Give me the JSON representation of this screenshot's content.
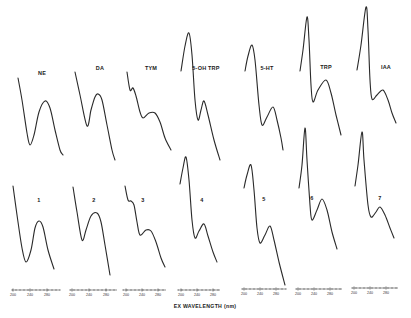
{
  "chart_data": {
    "type": "line",
    "title": "",
    "xlabel": "EX WAVELENGTH (nm)",
    "ylabel": "",
    "grid": false,
    "legend": "none",
    "layout": "2 rows x 7 panels; top row = standards, bottom row = samples",
    "panels": [
      {
        "label": "NE",
        "row": 1,
        "col": 1,
        "shape": "descending, min, then single peak",
        "points": [
          [
            18,
            78
          ],
          [
            22,
            100
          ],
          [
            27,
            133
          ],
          [
            30,
            145
          ],
          [
            34,
            135
          ],
          [
            39,
            112
          ],
          [
            45,
            101
          ],
          [
            50,
            108
          ],
          [
            55,
            130
          ],
          [
            60,
            150
          ],
          [
            63,
            155
          ]
        ]
      },
      {
        "label": "DA",
        "row": 1,
        "col": 2,
        "shape": "descending, min, then single peak",
        "points": [
          [
            75,
            72
          ],
          [
            80,
            95
          ],
          [
            87,
            126
          ],
          [
            91,
            110
          ],
          [
            95,
            97
          ],
          [
            98,
            94
          ],
          [
            102,
            100
          ],
          [
            107,
            125
          ],
          [
            112,
            150
          ],
          [
            115,
            160
          ]
        ]
      },
      {
        "label": "TYM",
        "row": 1,
        "col": 3,
        "shape": "shoulder, descending, broad hump",
        "points": [
          [
            127,
            72
          ],
          [
            130,
            90
          ],
          [
            133,
            88
          ],
          [
            136,
            96
          ],
          [
            140,
            112
          ],
          [
            143,
            118
          ],
          [
            149,
            113
          ],
          [
            155,
            113
          ],
          [
            160,
            122
          ],
          [
            165,
            138
          ],
          [
            171,
            150
          ]
        ]
      },
      {
        "label": "5-OH TRP",
        "row": 1,
        "col": 4,
        "shape": "sharp peak, drop, hump",
        "points": [
          [
            181,
            71
          ],
          [
            185,
            46
          ],
          [
            189,
            33
          ],
          [
            192,
            55
          ],
          [
            195,
            100
          ],
          [
            198,
            120
          ],
          [
            201,
            110
          ],
          [
            204,
            101
          ],
          [
            208,
            115
          ],
          [
            214,
            140
          ],
          [
            220,
            160
          ]
        ]
      },
      {
        "label": "5-HT",
        "row": 1,
        "col": 5,
        "shape": "sharp peak, drop, hump",
        "points": [
          [
            245,
            71
          ],
          [
            248,
            56
          ],
          [
            252,
            45
          ],
          [
            255,
            60
          ],
          [
            259,
            105
          ],
          [
            262,
            125
          ],
          [
            267,
            117
          ],
          [
            273,
            107
          ],
          [
            277,
            120
          ],
          [
            281,
            138
          ],
          [
            283,
            150
          ]
        ]
      },
      {
        "label": "TRP",
        "row": 1,
        "col": 6,
        "shape": "tall sharp peak, drop, hump",
        "points": [
          [
            300,
            71
          ],
          [
            303,
            50
          ],
          [
            307,
            17
          ],
          [
            309,
            40
          ],
          [
            311,
            85
          ],
          [
            313,
            102
          ],
          [
            318,
            90
          ],
          [
            326,
            80
          ],
          [
            331,
            93
          ],
          [
            336,
            115
          ],
          [
            341,
            135
          ]
        ]
      },
      {
        "label": "IAA",
        "row": 1,
        "col": 7,
        "shape": "tall sharp peak, drop, small hump",
        "points": [
          [
            357,
            70
          ],
          [
            361,
            45
          ],
          [
            366,
            7
          ],
          [
            368,
            30
          ],
          [
            370,
            80
          ],
          [
            372,
            99
          ],
          [
            377,
            95
          ],
          [
            383,
            90
          ],
          [
            388,
            100
          ],
          [
            392,
            113
          ],
          [
            396,
            123
          ]
        ]
      },
      {
        "label": "1",
        "row": 2,
        "col": 1,
        "shape": "like NE",
        "points": [
          [
            13,
            186
          ],
          [
            17,
            215
          ],
          [
            22,
            248
          ],
          [
            26,
            262
          ],
          [
            31,
            250
          ],
          [
            35,
            228
          ],
          [
            39,
            221
          ],
          [
            43,
            227
          ],
          [
            48,
            250
          ],
          [
            54,
            269
          ]
        ]
      },
      {
        "label": "2",
        "row": 2,
        "col": 2,
        "shape": "like DA",
        "points": [
          [
            73,
            187
          ],
          [
            77,
            212
          ],
          [
            82,
            240
          ],
          [
            86,
            230
          ],
          [
            91,
            216
          ],
          [
            97,
            213
          ],
          [
            101,
            222
          ],
          [
            105,
            245
          ],
          [
            110,
            275
          ]
        ]
      },
      {
        "label": "3",
        "row": 2,
        "col": 3,
        "shape": "like TYM",
        "points": [
          [
            125,
            186
          ],
          [
            128,
            200
          ],
          [
            131,
            201
          ],
          [
            134,
            205
          ],
          [
            137,
            222
          ],
          [
            140,
            235
          ],
          [
            146,
            230
          ],
          [
            151,
            231
          ],
          [
            156,
            242
          ],
          [
            161,
            258
          ],
          [
            165,
            267
          ]
        ]
      },
      {
        "label": "4",
        "row": 2,
        "col": 4,
        "shape": "like 5-OH TRP",
        "points": [
          [
            180,
            184
          ],
          [
            183,
            168
          ],
          [
            186,
            157
          ],
          [
            189,
            180
          ],
          [
            192,
            220
          ],
          [
            195,
            238
          ],
          [
            199,
            231
          ],
          [
            204,
            224
          ],
          [
            208,
            236
          ],
          [
            213,
            252
          ],
          [
            217,
            262
          ]
        ]
      },
      {
        "label": "5",
        "row": 2,
        "col": 5,
        "shape": "like 5-HT",
        "points": [
          [
            244,
            188
          ],
          [
            247,
            175
          ],
          [
            251,
            165
          ],
          [
            254,
            190
          ],
          [
            257,
            228
          ],
          [
            260,
            243
          ],
          [
            265,
            235
          ],
          [
            270,
            226
          ],
          [
            274,
            240
          ],
          [
            279,
            262
          ],
          [
            285,
            285
          ]
        ]
      },
      {
        "label": "6",
        "row": 2,
        "col": 6,
        "shape": "like TRP",
        "points": [
          [
            299,
            188
          ],
          [
            302,
            165
          ],
          [
            305,
            128
          ],
          [
            307,
            160
          ],
          [
            310,
            205
          ],
          [
            312,
            220
          ],
          [
            317,
            210
          ],
          [
            322,
            199
          ],
          [
            327,
            210
          ],
          [
            332,
            232
          ],
          [
            337,
            249
          ]
        ]
      },
      {
        "label": "7",
        "row": 2,
        "col": 7,
        "shape": "like IAA",
        "points": [
          [
            355,
            186
          ],
          [
            358,
            165
          ],
          [
            362,
            132
          ],
          [
            364,
            160
          ],
          [
            368,
            205
          ],
          [
            371,
            217
          ],
          [
            376,
            212
          ],
          [
            380,
            207
          ],
          [
            385,
            215
          ],
          [
            390,
            228
          ],
          [
            394,
            238
          ]
        ]
      }
    ],
    "axes": [
      {
        "x1": 12,
        "x2": 60,
        "y": 290,
        "ticks": [
          {
            "x": 13,
            "label": "200"
          },
          {
            "x": 30,
            "label": "240"
          },
          {
            "x": 47,
            "label": "280"
          }
        ]
      },
      {
        "x1": 70,
        "x2": 117,
        "y": 290,
        "ticks": [
          {
            "x": 72,
            "label": "200"
          },
          {
            "x": 89,
            "label": "240"
          },
          {
            "x": 106,
            "label": "280"
          }
        ]
      },
      {
        "x1": 123,
        "x2": 166,
        "y": 290,
        "ticks": [
          {
            "x": 126,
            "label": "200"
          },
          {
            "x": 142,
            "label": "240"
          },
          {
            "x": 158,
            "label": "280"
          }
        ]
      },
      {
        "x1": 178,
        "x2": 220,
        "y": 290,
        "ticks": [
          {
            "x": 181,
            "label": "200"
          },
          {
            "x": 197,
            "label": "240"
          },
          {
            "x": 213,
            "label": "280"
          }
        ]
      },
      {
        "x1": 242,
        "x2": 286,
        "y": 289,
        "ticks": [
          {
            "x": 244,
            "label": "200"
          },
          {
            "x": 260,
            "label": "240"
          },
          {
            "x": 276,
            "label": "280"
          }
        ]
      },
      {
        "x1": 296,
        "x2": 342,
        "y": 289,
        "ticks": [
          {
            "x": 298,
            "label": "200"
          },
          {
            "x": 314,
            "label": "240"
          },
          {
            "x": 330,
            "label": "280"
          }
        ]
      },
      {
        "x1": 352,
        "x2": 398,
        "y": 288,
        "ticks": [
          {
            "x": 354,
            "label": "200"
          },
          {
            "x": 370,
            "label": "240"
          },
          {
            "x": 386,
            "label": "280"
          }
        ]
      }
    ],
    "x_unit": "nm",
    "x_range": [
      200,
      300
    ]
  },
  "labels": {
    "top": [
      {
        "text": "NE",
        "x": 42,
        "y": 74
      },
      {
        "text": "DA",
        "x": 100,
        "y": 69
      },
      {
        "text": "TYM",
        "x": 151,
        "y": 69
      },
      {
        "text": "5-OH TRP",
        "x": 206,
        "y": 69
      },
      {
        "text": "5-HT",
        "x": 267,
        "y": 69
      },
      {
        "text": "TRP",
        "x": 326,
        "y": 68
      },
      {
        "text": "IAA",
        "x": 386,
        "y": 68
      }
    ],
    "bottom": [
      {
        "text": "1",
        "x": 39,
        "y": 201
      },
      {
        "text": "2",
        "x": 94,
        "y": 201
      },
      {
        "text": "3",
        "x": 143,
        "y": 201
      },
      {
        "text": "4",
        "x": 202,
        "y": 201
      },
      {
        "text": "5",
        "x": 264,
        "y": 200
      },
      {
        "text": "6",
        "x": 312,
        "y": 199
      },
      {
        "text": "7",
        "x": 380,
        "y": 199
      }
    ],
    "xlabel": "EX WAVELENGTH (nm)"
  }
}
